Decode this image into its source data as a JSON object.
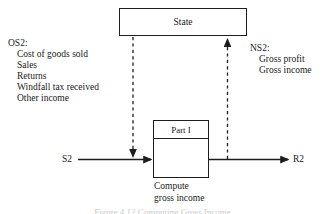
{
  "figure": {
    "type": "data-flow-diagram",
    "line_color": "#1d1d1d",
    "background": "#ffffff"
  },
  "state_box": {
    "label": "State"
  },
  "process_box": {
    "header": "Part I",
    "caption_line1": "Compute",
    "caption_line2": "gross income"
  },
  "flow": {
    "input_label": "S2",
    "output_label": "R2"
  },
  "old_state": {
    "heading": "OS2:",
    "items": [
      "Cost of goods sold",
      "Sales",
      "Returns",
      "Windfall tax received",
      "Other income"
    ]
  },
  "new_state": {
    "heading": "NS2:",
    "items": [
      "Gross profit",
      "Gross income"
    ]
  },
  "bottom_caption": {
    "text": "Figure 4.12  Computing Gross Income"
  }
}
